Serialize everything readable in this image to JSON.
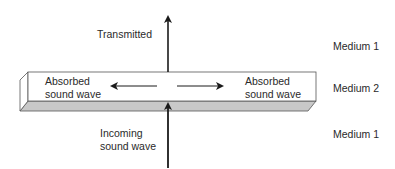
{
  "labels": {
    "transmitted": "Transmitted",
    "absorbed_left": "Absorbed\nsound wave",
    "absorbed_right": "Absorbed\nsound wave",
    "incoming": "Incoming\nsound wave",
    "medium_top": "Medium 1",
    "medium_middle": "Medium 2",
    "medium_bottom": "Medium 1"
  },
  "colors": {
    "slab_face": "#ffffff",
    "slab_bottom": "#c8c8c8",
    "stroke": "#1a1a1a"
  }
}
